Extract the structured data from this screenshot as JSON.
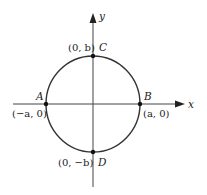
{
  "diagram": {
    "title": "",
    "type": "ellipse-on-axes",
    "axes": {
      "x_label": "x",
      "y_label": "y"
    },
    "curve": {
      "description": "ellipse centered at origin with semi-axes a (horizontal) and b (vertical)",
      "stroke_color": "#333333"
    },
    "points": [
      {
        "name": "A",
        "coords": "(−a, 0)"
      },
      {
        "name": "B",
        "coords": "(a, 0)"
      },
      {
        "name": "C",
        "coords": "(0, b)"
      },
      {
        "name": "D",
        "coords": "(0, −b)"
      }
    ]
  }
}
